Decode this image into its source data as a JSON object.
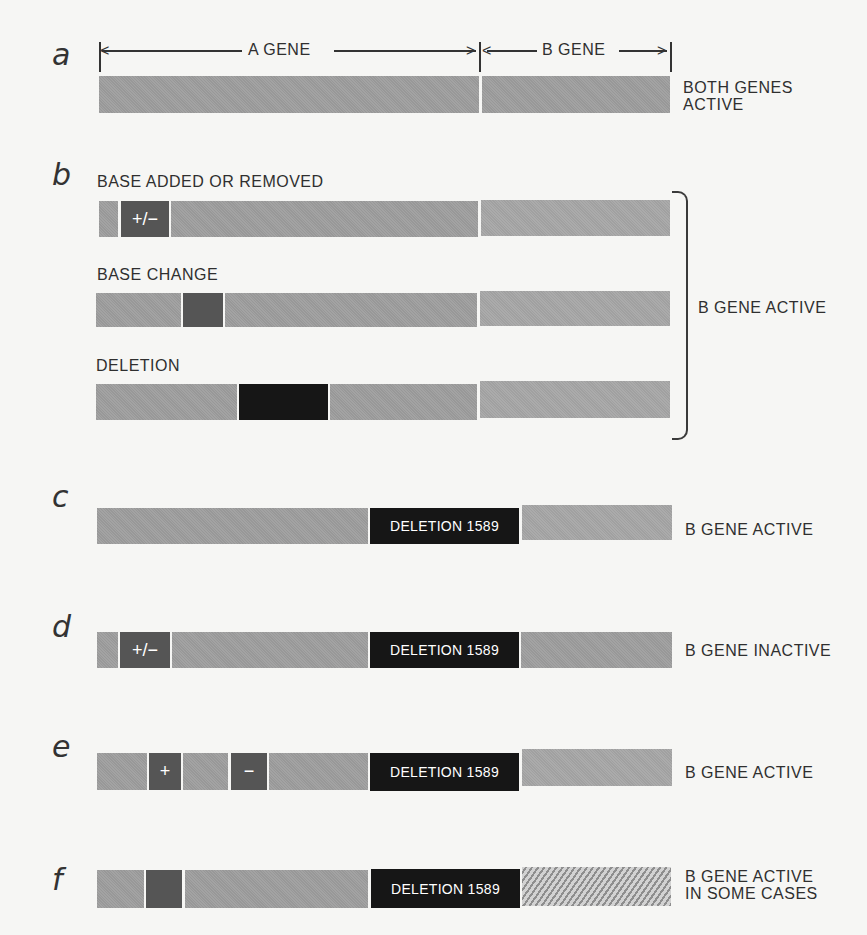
{
  "figure": {
    "rows": [
      {
        "letter": "a",
        "a_gene_label": "A GENE",
        "b_gene_label": "B GENE",
        "status": "BOTH GENES ACTIVE",
        "status_lines": [
          "BOTH GENES",
          "ACTIVE"
        ]
      },
      {
        "letter": "b",
        "subrows": [
          {
            "label": "BASE ADDED OR REMOVED",
            "marker": "+/−"
          },
          {
            "label": "BASE CHANGE",
            "marker": ""
          },
          {
            "label": "DELETION",
            "marker": ""
          }
        ],
        "status": "B GENE ACTIVE"
      },
      {
        "letter": "c",
        "deletion_label": "DELETION 1589",
        "status": "B GENE ACTIVE"
      },
      {
        "letter": "d",
        "marker": "+/−",
        "deletion_label": "DELETION 1589",
        "status": "B GENE INACTIVE"
      },
      {
        "letter": "e",
        "marker_plus": "+",
        "marker_minus": "−",
        "deletion_label": "DELETION 1589",
        "status": "B GENE ACTIVE"
      },
      {
        "letter": "f",
        "deletion_label": "DELETION 1589",
        "status": "B GENE ACTIVE IN SOME CASES",
        "status_lines": [
          "B GENE ACTIVE",
          "IN SOME CASES"
        ]
      }
    ],
    "colors": {
      "gene_gray": "#9e9e9e",
      "b_gene_gray": "#a7a7a7",
      "mutation_dark": "#555555",
      "deletion_black": "#161616",
      "background": "#f6f6f4"
    }
  }
}
